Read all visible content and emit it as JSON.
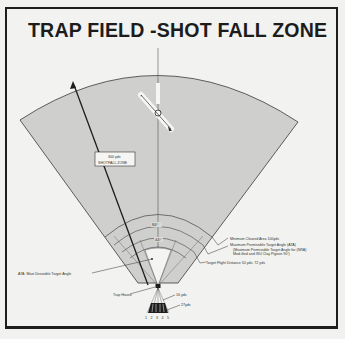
{
  "title": "TRAP FIELD -SHOT FALL ZONE",
  "colors": {
    "background": "#f2f2f0",
    "zone_fill": "#cfcfcd",
    "lines": "#2a2a2a",
    "border": "#1e1e1e"
  },
  "shotfall_zone": {
    "label_line1": "300 yds",
    "label_line2": "SHOTFALL ZONE"
  },
  "angles": {
    "outer": "84°",
    "inner": "44°"
  },
  "callouts": {
    "min_cleared_area": "Minimum Cleared Area 100yds",
    "max_angle_line1": "Maximum Permissible Target Angle (ATA)",
    "max_angle_line2": "(Maximum Permissible Target Angle for (NRA)",
    "max_angle_line3": "Mod-ified and ISU Clay Pigeon 90°)",
    "target_flight": "Target Flight Distance 50 yds. 72 yds",
    "ata": "ATA: Most Desirable Target Angle",
    "trap_house": "Trap House",
    "yds16": "16 yds",
    "yds27": "27yds"
  },
  "stations": [
    "1",
    "2",
    "3",
    "4",
    "5"
  ]
}
